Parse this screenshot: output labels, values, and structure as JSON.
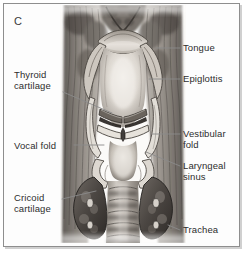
{
  "figure": {
    "panel_letter": "C",
    "title_visible": false,
    "view": "posterior coronal section of the larynx"
  },
  "labels": {
    "left": [
      {
        "id": "thyroid-cartilage",
        "text": "Thyroid\ncartilage",
        "x": 14,
        "y": 69
      },
      {
        "id": "vocal-fold",
        "text": "Vocal fold",
        "x": 14,
        "y": 140
      },
      {
        "id": "cricoid-cartilage",
        "text": "Cricoid\ncartilage",
        "x": 14,
        "y": 192
      }
    ],
    "right": [
      {
        "id": "tongue",
        "text": "Tongue",
        "x": 183,
        "y": 42
      },
      {
        "id": "epiglottis",
        "text": "Epiglottis",
        "x": 183,
        "y": 73
      },
      {
        "id": "vestibular-fold",
        "text": "Vestibular\nfold",
        "x": 183,
        "y": 128
      },
      {
        "id": "laryngeal-sinus",
        "text": "Laryngeal\nsinus",
        "x": 183,
        "y": 160
      },
      {
        "id": "trachea",
        "text": "Trachea",
        "x": 183,
        "y": 224
      }
    ]
  },
  "leaders": [
    {
      "id": "leader-thyroid-cartilage",
      "points": "63,92 112,113"
    },
    {
      "id": "leader-vocal-fold",
      "points": "74,145 104,145"
    },
    {
      "id": "leader-cricoid-cartilage",
      "points": "62,199 96,191"
    },
    {
      "id": "leader-tongue",
      "points": "157,48 180,48"
    },
    {
      "id": "leader-epiglottis",
      "points": "149,79 180,79"
    },
    {
      "id": "leader-vestibular-fold",
      "points": "152,134 180,134"
    },
    {
      "id": "leader-laryngeal-sinus",
      "points": "146,152 180,166"
    },
    {
      "id": "leader-trachea",
      "points": "168,225 180,230"
    }
  ],
  "colors": {
    "frame_border": "#8e8e8e",
    "label_text": "#2d2d2d",
    "leader_line": "#8a8a8a",
    "background": "#ffffff",
    "tissue_dark": "#4a4542",
    "tissue_mid": "#8d8781",
    "tissue_light": "#d8d3cd",
    "lumen_highlight": "#efece7"
  }
}
